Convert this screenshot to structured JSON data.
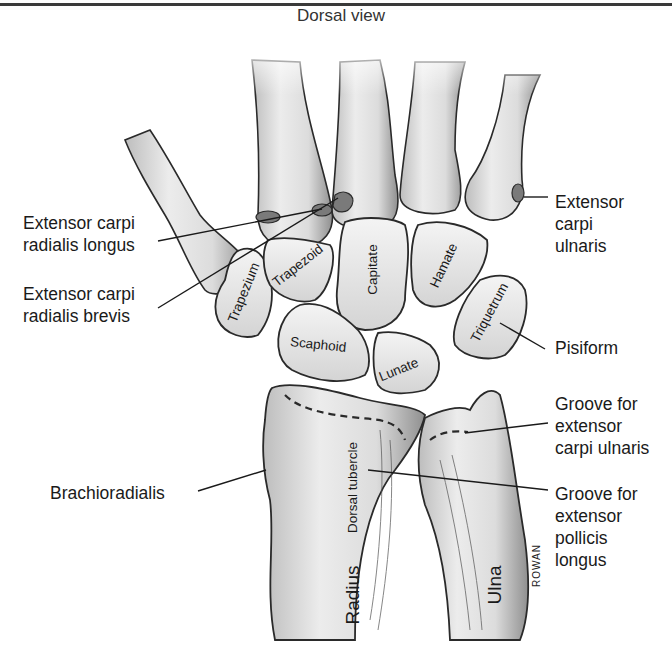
{
  "title": "Dorsal view",
  "labels": {
    "ecrl": "Extensor carpi\nradialis longus",
    "ecrb": "Extensor carpi\nradialis brevis",
    "ecu": "Extensor\ncarpi\nulnaris",
    "pisiform": "Pisiform",
    "groove_ecu": "Groove for\nextensor\ncarpi ulnaris",
    "groove_epl": "Groove for\nextensor\npollicis\nlongus",
    "brachioradialis": "Brachioradialis"
  },
  "bones": {
    "trapezium": "Trapezium",
    "trapezoid": "Trapezoid",
    "capitate": "Capitate",
    "hamate": "Hamate",
    "triquetrum": "Triquetrum",
    "scaphoid": "Scaphoid",
    "lunate": "Lunate",
    "dorsal_tubercle": "Dorsal tubercle",
    "radius": "Radius",
    "ulna": "Ulna"
  },
  "signature": "ROWAN"
}
